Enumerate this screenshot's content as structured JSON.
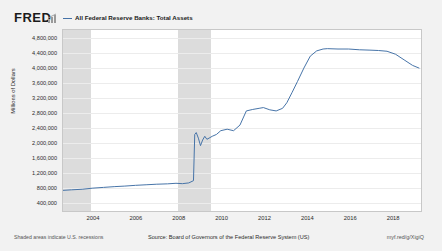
{
  "brand": {
    "logo_text": "FRED",
    "mark_name": "fred-chart-mark"
  },
  "legend": {
    "swatch_name": "legend-line-swatch",
    "label": "All Federal Reserve Banks: Total Assets",
    "color": "#4572a7"
  },
  "footer": {
    "note": "Shaded areas indicate U.S. recessions",
    "source": "Source: Board of Governors of the Federal Reserve System (US)",
    "link": "myf.red/g/XigiQ"
  },
  "chart_data": {
    "type": "line",
    "title": "All Federal Reserve Banks: Total Assets",
    "xlabel": "",
    "ylabel": "Millions of Dollars",
    "grid": true,
    "legend_position": "top",
    "line_color": "#4572a7",
    "recession_color": "#dcdcdc",
    "xlim": [
      2002.6,
      2019.3
    ],
    "ylim": [
      200000,
      5000000
    ],
    "xticks": [
      "2004",
      "2006",
      "2008",
      "2010",
      "2012",
      "2014",
      "2016",
      "2018"
    ],
    "xtick_values": [
      2004,
      2006,
      2008,
      2010,
      2012,
      2014,
      2016,
      2018
    ],
    "yticks": [
      "4,800,000",
      "4,400,000",
      "4,000,000",
      "3,600,000",
      "3,200,000",
      "2,800,000",
      "2,400,000",
      "2,000,000",
      "1,600,000",
      "1,200,000",
      "800,000",
      "400,000"
    ],
    "ytick_values": [
      4800000,
      4400000,
      4000000,
      3600000,
      3200000,
      2800000,
      2400000,
      2000000,
      1600000,
      1200000,
      800000,
      400000
    ],
    "recessions": [
      {
        "start": 2002.6,
        "end": 2003.9
      },
      {
        "start": 2007.95,
        "end": 2009.5
      }
    ],
    "series": [
      {
        "name": "All Federal Reserve Banks: Total Assets",
        "x": [
          2002.6,
          2003.0,
          2003.5,
          2004.0,
          2004.5,
          2005.0,
          2005.5,
          2006.0,
          2006.5,
          2007.0,
          2007.5,
          2007.9,
          2008.2,
          2008.5,
          2008.72,
          2008.78,
          2008.85,
          2008.95,
          2009.05,
          2009.15,
          2009.25,
          2009.35,
          2009.45,
          2009.6,
          2009.8,
          2010.0,
          2010.3,
          2010.6,
          2010.9,
          2011.2,
          2011.5,
          2011.8,
          2012.0,
          2012.3,
          2012.6,
          2012.9,
          2013.1,
          2013.35,
          2013.6,
          2013.9,
          2014.2,
          2014.5,
          2014.8,
          2015.0,
          2015.5,
          2016.0,
          2016.5,
          2017.0,
          2017.4,
          2017.8,
          2018.2,
          2018.6,
          2019.0,
          2019.3
        ],
        "y": [
          700000,
          715000,
          730000,
          760000,
          780000,
          800000,
          815000,
          835000,
          850000,
          865000,
          875000,
          890000,
          880000,
          900000,
          960000,
          2200000,
          2250000,
          2100000,
          1900000,
          2050000,
          2150000,
          2070000,
          2100000,
          2150000,
          2200000,
          2300000,
          2340000,
          2300000,
          2450000,
          2830000,
          2870000,
          2900000,
          2920000,
          2860000,
          2830000,
          2900000,
          3050000,
          3330000,
          3620000,
          3980000,
          4300000,
          4440000,
          4490000,
          4500000,
          4490000,
          4490000,
          4470000,
          4460000,
          4450000,
          4430000,
          4350000,
          4200000,
          4050000,
          3980000
        ]
      }
    ]
  }
}
